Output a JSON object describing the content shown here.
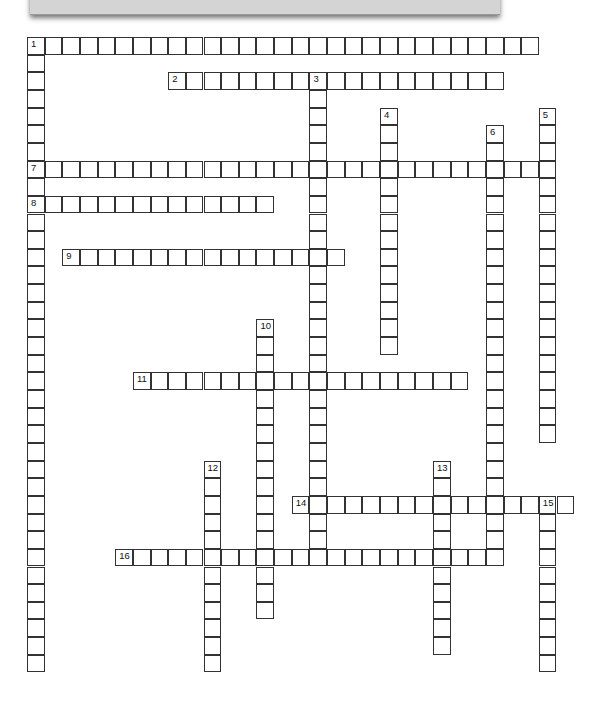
{
  "puzzle": {
    "title": "",
    "cell_size": 17.65,
    "origin": {
      "x": 27,
      "y": 37
    },
    "entries": [
      {
        "number": 1,
        "direction": "across",
        "row": 0,
        "col": 0,
        "length": 29
      },
      {
        "number": 1,
        "direction": "down",
        "row": 0,
        "col": 0,
        "length": 36
      },
      {
        "number": 2,
        "direction": "across",
        "row": 2,
        "col": 8,
        "length": 19
      },
      {
        "number": 3,
        "direction": "down",
        "row": 2,
        "col": 16,
        "length": 27
      },
      {
        "number": 4,
        "direction": "down",
        "row": 4,
        "col": 20,
        "length": 14
      },
      {
        "number": 5,
        "direction": "down",
        "row": 4,
        "col": 29,
        "length": 19
      },
      {
        "number": 6,
        "direction": "down",
        "row": 5,
        "col": 26,
        "length": 25
      },
      {
        "number": 7,
        "direction": "across",
        "row": 7,
        "col": 0,
        "length": 30
      },
      {
        "number": 8,
        "direction": "across",
        "row": 9,
        "col": 0,
        "length": 14
      },
      {
        "number": 9,
        "direction": "across",
        "row": 12,
        "col": 2,
        "length": 16
      },
      {
        "number": 10,
        "direction": "down",
        "row": 16,
        "col": 13,
        "length": 17
      },
      {
        "number": 11,
        "direction": "across",
        "row": 19,
        "col": 6,
        "length": 19
      },
      {
        "number": 12,
        "direction": "down",
        "row": 24,
        "col": 10,
        "length": 12
      },
      {
        "number": 13,
        "direction": "down",
        "row": 24,
        "col": 23,
        "length": 11
      },
      {
        "number": 14,
        "direction": "across",
        "row": 26,
        "col": 15,
        "length": 16
      },
      {
        "number": 15,
        "direction": "down",
        "row": 26,
        "col": 29,
        "length": 10
      },
      {
        "number": 16,
        "direction": "across",
        "row": 29,
        "col": 5,
        "length": 22
      }
    ]
  }
}
